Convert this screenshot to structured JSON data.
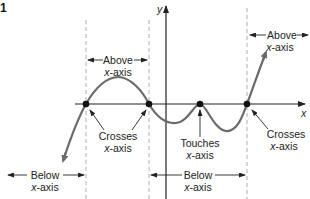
{
  "figure": {
    "number": "1",
    "axes": {
      "x_label": "x",
      "y_label": "y"
    },
    "colors": {
      "curve": "#6a6a6a",
      "axis": "#222222",
      "dashed": "#b0b0b0",
      "point": "#111111"
    },
    "annotations": {
      "above_left": {
        "line1": "Above",
        "line2": "x-axis"
      },
      "above_right": {
        "line1": "Above",
        "line2": "x-axis"
      },
      "below_left": {
        "line1": "Below",
        "line2": "x-axis"
      },
      "below_middle": {
        "line1": "Below",
        "line2": "x-axis"
      },
      "crosses_left": {
        "line1": "Crosses",
        "line2": "x-axis"
      },
      "touches": {
        "line1": "Touches",
        "line2": "x-axis"
      },
      "crosses_right": {
        "line1": "Crosses",
        "line2": "x-axis"
      }
    },
    "x_intercepts": [
      {
        "label": "Crosses x-axis",
        "type": "crosses"
      },
      {
        "label": "Crosses x-axis",
        "type": "crosses"
      },
      {
        "label": "Touches x-axis",
        "type": "touches"
      },
      {
        "label": "Crosses x-axis",
        "type": "crosses"
      }
    ]
  }
}
